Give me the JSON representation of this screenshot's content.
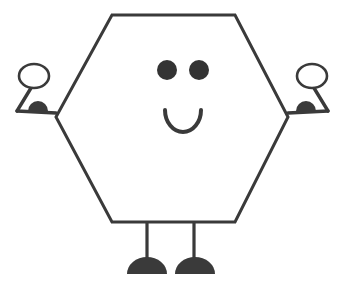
{
  "canvas": {
    "width": 345,
    "height": 283,
    "background_color": "#ffffff",
    "title": "Smiling hexagon character drawing"
  },
  "style": {
    "stroke_color": "#3a3a3a",
    "fill_color": "#3a3a3a",
    "body_fill": "#ffffff",
    "stroke_width": 3,
    "thin_stroke_width": 2.6
  },
  "figure": {
    "name": "hexagon-character",
    "body": {
      "name": "hexagon-body",
      "shape": "hexagon",
      "points": "112,15 235,15 288,117 235,222 112,222 56,117",
      "fill": "#ffffff",
      "stroke": "#3a3a3a",
      "stroke_width": 3
    },
    "face": {
      "left_eye": {
        "name": "left-eye",
        "cx": 167,
        "cy": 70,
        "r": 10,
        "fill": "#333333"
      },
      "right_eye": {
        "name": "right-eye",
        "cx": 199,
        "cy": 70,
        "r": 10,
        "fill": "#333333"
      },
      "mouth": {
        "name": "mouth",
        "shape": "smile-arc",
        "path": "M 165 110 A 18 22 0 0 0 201 110",
        "stroke": "#3a3a3a",
        "stroke_width": 4,
        "fill": "none"
      }
    },
    "left_arm": {
      "name": "left-arm",
      "balloon": {
        "name": "left-hand-oval",
        "cx": 34,
        "cy": 76,
        "rx": 15,
        "ry": 12
      },
      "upper_path": "M 31 88 L 17 111",
      "forearm_path": "M 17 111 L 56 113",
      "hand": {
        "name": "left-hand-semicircle",
        "path": "M 28 111 A 10 10 0 0 1 48 111 Z",
        "fill": "#3a3a3a"
      }
    },
    "right_arm": {
      "name": "right-arm",
      "balloon": {
        "name": "right-hand-oval",
        "cx": 312,
        "cy": 76,
        "rx": 15,
        "ry": 12
      },
      "upper_path": "M 314 88 L 328 111",
      "forearm_path": "M 328 111 L 288 113",
      "hand": {
        "name": "right-hand-semicircle",
        "path": "M 296 111 A 10 10 0 0 1 316 111 Z",
        "fill": "#3a3a3a"
      }
    },
    "left_leg": {
      "name": "left-leg",
      "line_path": "M 147 222 L 147 259",
      "foot": {
        "name": "left-foot",
        "path": "M 127 274 A 20 17 0 0 1 167 274 Z",
        "fill": "#3a3a3a"
      }
    },
    "right_leg": {
      "name": "right-leg",
      "line_path": "M 194 222 L 194 259",
      "foot": {
        "name": "right-foot",
        "path": "M 175 274 A 20 17 0 0 1 215 274 Z",
        "fill": "#3a3a3a"
      }
    }
  }
}
